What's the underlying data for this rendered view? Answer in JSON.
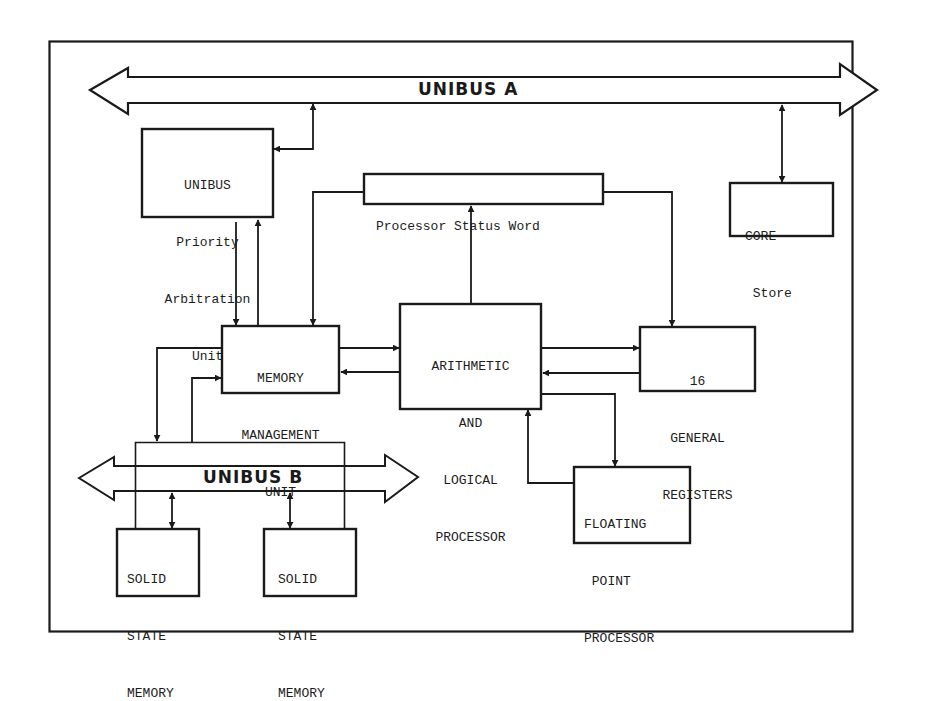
{
  "diagram": {
    "colors": {
      "ink": "#1a1a1a",
      "background": "#ffffff"
    },
    "buses": {
      "unibus_a": {
        "label": "UNIBUS A"
      },
      "unibus_b": {
        "label": "UNIBUS B"
      }
    },
    "blocks": {
      "priority_arbitration": {
        "lines": [
          "UNIBUS",
          "Priority",
          "Arbitration",
          "Unit"
        ]
      },
      "processor_status_word": {
        "lines": [
          "Processor Status Word"
        ]
      },
      "core_store": {
        "lines": [
          "CORE",
          " Store"
        ]
      },
      "memory_management": {
        "lines": [
          "MEMORY",
          "MANAGEMENT",
          "UNIT"
        ]
      },
      "alu": {
        "lines": [
          "ARITHMETIC",
          "AND",
          "LOGICAL",
          "PROCESSOR"
        ]
      },
      "general_registers": {
        "lines": [
          "16",
          "GENERAL",
          "REGISTERS"
        ]
      },
      "floating_point": {
        "lines": [
          "FLOATING",
          " POINT",
          "PROCESSOR"
        ]
      },
      "solid_state_memory_1": {
        "lines": [
          "SOLID",
          "STATE",
          "MEMORY"
        ]
      },
      "solid_state_memory_2": {
        "lines": [
          "SOLID",
          "STATE",
          "MEMORY"
        ]
      }
    },
    "connections": [
      {
        "from": "UNIBUS Priority Arbitration Unit",
        "to": "UNIBUS A",
        "type": "bidirectional"
      },
      {
        "from": "CORE Store",
        "to": "UNIBUS A",
        "type": "bidirectional"
      },
      {
        "from": "UNIBUS Priority Arbitration Unit",
        "to": "MEMORY MANAGEMENT UNIT",
        "type": "directed"
      },
      {
        "from": "MEMORY MANAGEMENT UNIT",
        "to": "UNIBUS Priority Arbitration Unit",
        "type": "directed"
      },
      {
        "from": "Processor Status Word",
        "to": "MEMORY MANAGEMENT UNIT",
        "type": "directed"
      },
      {
        "from": "Processor Status Word",
        "to": "16 GENERAL REGISTERS",
        "type": "directed"
      },
      {
        "from": "ARITHMETIC AND LOGICAL PROCESSOR",
        "to": "Processor Status Word",
        "type": "directed"
      },
      {
        "from": "MEMORY MANAGEMENT UNIT",
        "to": "ARITHMETIC AND LOGICAL PROCESSOR",
        "type": "directed"
      },
      {
        "from": "ARITHMETIC AND LOGICAL PROCESSOR",
        "to": "MEMORY MANAGEMENT UNIT",
        "type": "directed"
      },
      {
        "from": "ARITHMETIC AND LOGICAL PROCESSOR",
        "to": "16 GENERAL REGISTERS",
        "type": "directed"
      },
      {
        "from": "16 GENERAL REGISTERS",
        "to": "ARITHMETIC AND LOGICAL PROCESSOR",
        "type": "directed"
      },
      {
        "from": "ARITHMETIC AND LOGICAL PROCESSOR",
        "to": "FLOATING POINT PROCESSOR",
        "type": "directed"
      },
      {
        "from": "FLOATING POINT PROCESSOR",
        "to": "ARITHMETIC AND LOGICAL PROCESSOR",
        "type": "directed"
      },
      {
        "from": "MEMORY MANAGEMENT UNIT",
        "to": "UNIBUS B",
        "type": "directed"
      },
      {
        "from": "UNIBUS B",
        "to": "MEMORY MANAGEMENT UNIT",
        "type": "directed"
      },
      {
        "from": "SOLID STATE MEMORY (1)",
        "to": "UNIBUS B",
        "type": "bidirectional"
      },
      {
        "from": "SOLID STATE MEMORY (2)",
        "to": "UNIBUS B",
        "type": "bidirectional"
      }
    ]
  }
}
